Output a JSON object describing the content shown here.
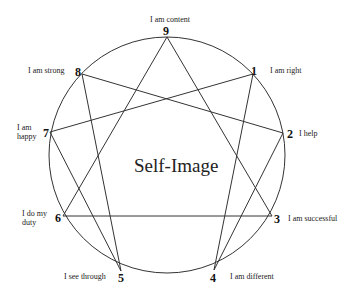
{
  "diagram": {
    "title": "Self-Image",
    "points": [
      {
        "num": "9",
        "label": [
          "I am content"
        ]
      },
      {
        "num": "1",
        "label": [
          "I am right"
        ]
      },
      {
        "num": "2",
        "label": [
          "I help"
        ]
      },
      {
        "num": "3",
        "label": [
          "I am successful"
        ]
      },
      {
        "num": "4",
        "label": [
          "I am different"
        ]
      },
      {
        "num": "5",
        "label": [
          "I see through"
        ]
      },
      {
        "num": "6",
        "label": [
          "I do my",
          "duty"
        ]
      },
      {
        "num": "7",
        "label": [
          "I am",
          "happy"
        ]
      },
      {
        "num": "8",
        "label": [
          "I am strong"
        ]
      }
    ],
    "connections": [
      [
        "9",
        "3"
      ],
      [
        "3",
        "6"
      ],
      [
        "6",
        "9"
      ],
      [
        "1",
        "4"
      ],
      [
        "4",
        "2"
      ],
      [
        "2",
        "8"
      ],
      [
        "8",
        "5"
      ],
      [
        "5",
        "7"
      ],
      [
        "7",
        "1"
      ]
    ]
  }
}
